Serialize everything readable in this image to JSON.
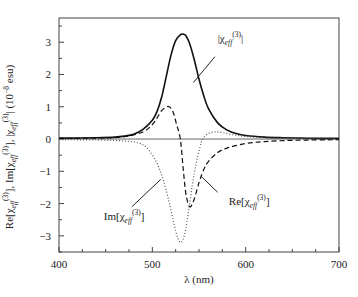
{
  "chart_data": {
    "type": "line",
    "title": "",
    "xlabel": "λ (nm)",
    "ylabel": {
      "text": "Re[χeff(3)], Im[χeff(3)], |χeff(3)| (10^-8 esu)",
      "parts": [
        "Re[χ",
        "eff",
        "(3)",
        "], Im[χ",
        "eff",
        "(3)",
        "], |χ",
        "eff",
        "(3)",
        "| (10",
        "−8",
        " esu)"
      ]
    },
    "xlim": [
      400,
      700
    ],
    "ylim": [
      -3.5,
      3.75
    ],
    "xticks": [
      400,
      500,
      600,
      700
    ],
    "xtick_labels": [
      "400",
      "500",
      "600",
      "700"
    ],
    "yticks": [
      -3,
      -2,
      -1,
      0,
      1,
      2,
      3
    ],
    "ytick_labels": [
      "−3",
      "−2",
      "−1",
      "0",
      "1",
      "2",
      "3"
    ],
    "grid": false,
    "zero_line": true,
    "series": [
      {
        "name": "|χeff(3)|",
        "style": "solid",
        "x": [
          400,
          420,
          440,
          460,
          470,
          480,
          490,
          500,
          505,
          510,
          515,
          520,
          525,
          530,
          533,
          536,
          540,
          545,
          550,
          555,
          560,
          570,
          580,
          590,
          600,
          620,
          640,
          660,
          680,
          700
        ],
        "y": [
          0.03,
          0.03,
          0.04,
          0.06,
          0.09,
          0.15,
          0.3,
          0.58,
          0.85,
          1.3,
          1.95,
          2.6,
          3.05,
          3.23,
          3.25,
          3.2,
          2.95,
          2.45,
          1.85,
          1.35,
          0.95,
          0.5,
          0.28,
          0.17,
          0.11,
          0.06,
          0.04,
          0.03,
          0.02,
          0.02
        ]
      },
      {
        "name": "Re[χeff(3)]",
        "style": "dashed",
        "x": [
          400,
          440,
          470,
          490,
          500,
          505,
          510,
          515,
          518,
          522,
          526,
          530,
          533,
          536,
          540,
          545,
          550,
          555,
          560,
          570,
          580,
          600,
          620,
          650,
          700
        ],
        "y": [
          0.02,
          0.03,
          0.07,
          0.22,
          0.45,
          0.65,
          0.88,
          0.99,
          1.0,
          0.85,
          0.45,
          0.0,
          -0.9,
          -1.7,
          -2.1,
          -1.85,
          -1.35,
          -0.95,
          -0.7,
          -0.42,
          -0.28,
          -0.14,
          -0.08,
          -0.04,
          -0.02
        ]
      },
      {
        "name": "Im[χeff(3)]",
        "style": "dotted",
        "x": [
          400,
          440,
          470,
          485,
          495,
          505,
          512,
          518,
          523,
          527,
          531,
          535,
          539,
          543,
          547,
          551,
          554,
          560,
          567,
          575,
          585,
          600,
          620,
          650,
          700
        ],
        "y": [
          -0.02,
          -0.03,
          -0.06,
          -0.12,
          -0.3,
          -0.75,
          -1.3,
          -1.95,
          -2.6,
          -3.05,
          -3.2,
          -2.9,
          -2.2,
          -1.4,
          -0.75,
          -0.25,
          0.0,
          0.17,
          0.22,
          0.2,
          0.14,
          0.08,
          0.04,
          0.02,
          0.01
        ]
      }
    ],
    "annotations": [
      {
        "id": "abs",
        "text_parts": [
          "|χ",
          "eff",
          "(3)",
          "|"
        ],
        "series": "|χeff(3)|",
        "label_at": [
          570,
          3.0
        ],
        "arrow_from": [
          567,
          2.55
        ],
        "arrow_to": [
          544,
          1.75
        ]
      },
      {
        "id": "re",
        "text_parts": [
          "Re[χ",
          "eff",
          "(3)",
          "]"
        ],
        "series": "Re[χeff(3)]",
        "label_at": [
          582,
          -2.05
        ],
        "arrow_from": [
          570,
          -1.65
        ],
        "arrow_to": [
          552,
          -1.15
        ]
      },
      {
        "id": "im",
        "text_parts": [
          "Im[χ",
          "eff",
          "(3)",
          "]"
        ],
        "series": "Im[χeff(3)]",
        "label_at": [
          448,
          -2.5
        ],
        "arrow_from": [
          478,
          -2.1
        ],
        "arrow_to": [
          509,
          -1.25
        ]
      }
    ]
  }
}
